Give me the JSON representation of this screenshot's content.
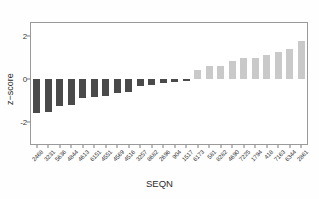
{
  "chart_data": {
    "type": "bar",
    "title": "",
    "xlabel": "SEQN",
    "ylabel": "z−score",
    "ylim": [
      -3.0,
      2.6
    ],
    "yticks": [
      2,
      0,
      -2
    ],
    "ytick_labels": [
      "2",
      "0",
      "-2"
    ],
    "grid": false,
    "legend": false,
    "orientation": "vertical",
    "categories": [
      "2468",
      "3231",
      "5636",
      "4844",
      "4613",
      "6151",
      "4551",
      "4569",
      "4516",
      "3257",
      "8682",
      "2696",
      "904",
      "1517",
      "6173",
      "581",
      "8282",
      "4690",
      "7225",
      "1794",
      "418",
      "7163",
      "6344",
      "2861"
    ],
    "values": [
      -1.58,
      -1.52,
      -1.22,
      -1.18,
      -0.88,
      -0.82,
      -0.78,
      -0.62,
      -0.58,
      -0.32,
      -0.26,
      -0.2,
      -0.12,
      -0.1,
      0.44,
      0.6,
      0.62,
      0.84,
      0.96,
      1.0,
      1.1,
      1.26,
      1.38,
      1.78
    ],
    "series": [
      {
        "name": "z-score",
        "values": [
          -1.58,
          -1.52,
          -1.22,
          -1.18,
          -0.88,
          -0.82,
          -0.78,
          -0.62,
          -0.58,
          -0.32,
          -0.26,
          -0.2,
          -0.12,
          -0.1,
          0.44,
          0.6,
          0.62,
          0.84,
          0.96,
          1.0,
          1.1,
          1.26,
          1.38,
          1.78
        ]
      }
    ],
    "colors": {
      "negative_bar": "#4a4a4a",
      "positive_bar": "#c9c9c9",
      "axis": "#9a9a9a",
      "text": "#2c2c2c",
      "background": "#ffffff"
    }
  }
}
